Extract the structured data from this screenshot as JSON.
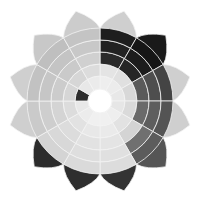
{
  "diagram": {
    "type": "color-star",
    "center": [
      100,
      101
    ],
    "petal_count": 12,
    "inner_radius": 12,
    "ring_radii": [
      12,
      25,
      37,
      49,
      61,
      73
    ],
    "tip_radius": 93,
    "outline_color": "#f2f2f2",
    "petals": [
      {
        "angle": 15,
        "shades": [
          "#f7f7f7",
          "#eeeeee",
          "#e4e4e4",
          "#2a2a2a",
          "#222222",
          "#1e1e1e"
        ],
        "tip": "#cfcfcf"
      },
      {
        "angle": 45,
        "shades": [
          "#f5f5f5",
          "#ececec",
          "#e0e0e0",
          "#262626",
          "#1c1c1c",
          "#161616"
        ],
        "tip": "#1a1a1a"
      },
      {
        "angle": 75,
        "shades": [
          "#f4f4f4",
          "#e8e8e8",
          "#d8d8d8",
          "#5a5a5a",
          "#4e4e4e",
          "#444444"
        ],
        "tip": "#cfcfcf"
      },
      {
        "angle": 105,
        "shades": [
          "#f3f3f3",
          "#e6e6e6",
          "#dadada",
          "#6a6a6a",
          "#5e5e5e",
          "#545454"
        ],
        "tip": "#cfcfcf"
      },
      {
        "angle": 135,
        "shades": [
          "#f6f6f6",
          "#eeeeee",
          "#e2e2e2",
          "#d4d4d4",
          "#707070",
          "#5c5c5c"
        ],
        "tip": "#555555"
      },
      {
        "angle": 165,
        "shades": [
          "#f8f8f8",
          "#f0f0f0",
          "#eaeaea",
          "#e4e4e4",
          "#e0e0e0",
          "#dcdcdc"
        ],
        "tip": "#333333"
      },
      {
        "angle": 195,
        "shades": [
          "#f8f8f8",
          "#f0f0f0",
          "#e8e8e8",
          "#e2e2e2",
          "#dedede",
          "#dadada"
        ],
        "tip": "#2e2e2e"
      },
      {
        "angle": 225,
        "shades": [
          "#f6f6f6",
          "#ececec",
          "#e2e2e2",
          "#dcdcdc",
          "#d8d8d8",
          "#d4d4d4"
        ],
        "tip": "#2c2c2c"
      },
      {
        "angle": 255,
        "shades": [
          "#f4f4f4",
          "#e8e8e8",
          "#dcdcdc",
          "#d4d4d4",
          "#cecece",
          "#cacaca"
        ],
        "tip": "#cfcfcf"
      },
      {
        "angle": 285,
        "shades": [
          "#f4f4f4",
          "#2e2e2e",
          "#d6d6d6",
          "#cccccc",
          "#c6c6c6",
          "#c2c2c2"
        ],
        "tip": "#cfcfcf"
      },
      {
        "angle": 315,
        "shades": [
          "#f5f5f5",
          "#e8e8e8",
          "#d6d6d6",
          "#cacaca",
          "#c4c4c4",
          "#bfbfbf"
        ],
        "tip": "#c8c8c8"
      },
      {
        "angle": 345,
        "shades": [
          "#f6f6f6",
          "#ebebeb",
          "#dcdcdc",
          "#d0d0d0",
          "#c8c8c8",
          "#c4c4c4"
        ],
        "tip": "#cccccc"
      }
    ]
  }
}
